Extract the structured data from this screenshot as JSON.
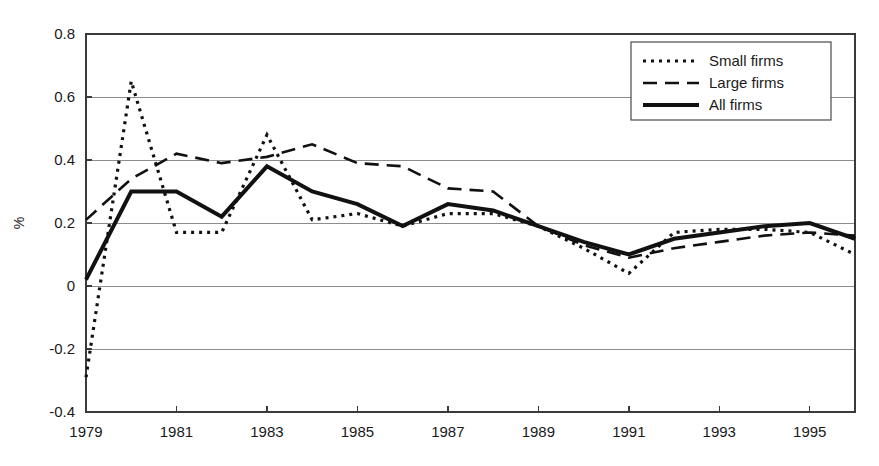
{
  "chart_data": {
    "type": "line",
    "title": "",
    "subtitle": "",
    "xlabel": "",
    "ylabel": "%",
    "xlim": [
      1979,
      1996
    ],
    "ylim": [
      -0.4,
      0.8
    ],
    "grid": true,
    "grid_axis": "y",
    "legend_position": "top-right",
    "x": [
      1979,
      1980,
      1981,
      1982,
      1983,
      1984,
      1985,
      1986,
      1987,
      1988,
      1989,
      1990,
      1991,
      1992,
      1993,
      1994,
      1995,
      1996
    ],
    "x_tick_labels": [
      "1979",
      "1981",
      "1983",
      "1985",
      "1987",
      "1989",
      "1991",
      "1993",
      "1995"
    ],
    "x_tick_values": [
      1979,
      1981,
      1983,
      1985,
      1987,
      1989,
      1991,
      1993,
      1995
    ],
    "x_minor_tick_values": [
      1980,
      1982,
      1984,
      1986,
      1988,
      1990,
      1992,
      1994,
      1996
    ],
    "y_tick_labels": [
      "0.8",
      "0.6",
      "0.4",
      "0.2",
      "0",
      "-0.2",
      "-0.4"
    ],
    "y_tick_values": [
      0.8,
      0.6,
      0.4,
      0.2,
      0,
      -0.2,
      -0.4
    ],
    "series": [
      {
        "name": "Small firms",
        "style": "dotted",
        "dash_pattern": "3,5",
        "stroke_width": 3.2,
        "values": [
          -0.29,
          0.65,
          0.17,
          0.17,
          0.48,
          0.21,
          0.23,
          0.19,
          0.23,
          0.23,
          0.19,
          0.12,
          0.04,
          0.17,
          0.18,
          0.18,
          0.17,
          0.1
        ]
      },
      {
        "name": "Large firms",
        "style": "dashed",
        "dash_pattern": "14,8",
        "stroke_width": 2.6,
        "values": [
          0.21,
          0.34,
          0.42,
          0.39,
          0.41,
          0.45,
          0.39,
          0.38,
          0.31,
          0.3,
          0.19,
          0.13,
          0.09,
          0.12,
          0.14,
          0.16,
          0.17,
          0.16
        ]
      },
      {
        "name": "All firms",
        "style": "solid",
        "dash_pattern": "none",
        "stroke_width": 4.0,
        "values": [
          0.02,
          0.3,
          0.3,
          0.22,
          0.38,
          0.3,
          0.26,
          0.19,
          0.26,
          0.24,
          0.19,
          0.14,
          0.1,
          0.15,
          0.17,
          0.19,
          0.2,
          0.15
        ]
      }
    ]
  },
  "legend": {
    "items": [
      {
        "label": "Small firms"
      },
      {
        "label": "Large firms"
      },
      {
        "label": "All firms"
      }
    ]
  },
  "colors": {
    "line": "#111111",
    "grid": "#8d8d8d",
    "frame": "#3a3a3a",
    "background": "#ffffff",
    "text": "#1a1a1a"
  }
}
